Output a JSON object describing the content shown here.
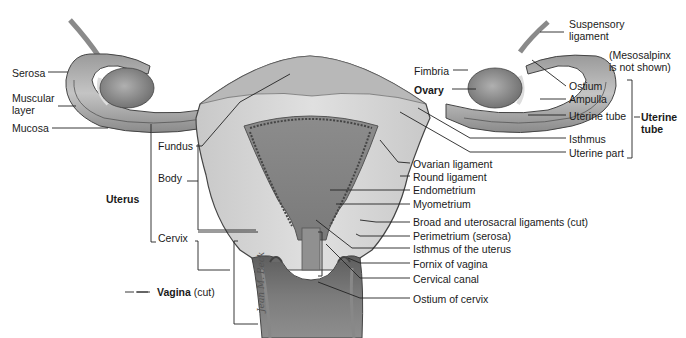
{
  "figure": {
    "signature": "Jean M. Beck",
    "labels_left": {
      "serosa": "Serosa",
      "muscular_layer_1": "Muscular",
      "muscular_layer_2": "layer",
      "mucosa": "Mucosa",
      "fundus": "Fundus",
      "body": "Body",
      "uterus": "Uterus",
      "cervix": "Cervix",
      "vagina": "Vagina",
      "vagina_suffix": "(cut)"
    },
    "labels_right": {
      "suspensory_1": "Suspensory",
      "suspensory_2": "ligament",
      "mesosalpinx_1": "(Mesosalpinx",
      "mesosalpinx_2": "is not shown)",
      "fimbria": "Fimbria",
      "ovary": "Ovary",
      "ostium": "Ostium",
      "ampulla": "Ampulla",
      "uterine_tube_part": "Uterine tube",
      "uterine_tube_group_1": "Uterine",
      "uterine_tube_group_2": "tube",
      "isthmus": "Isthmus",
      "uterine_part": "Uterine part",
      "ovarian_ligament": "Ovarian ligament",
      "round_ligament": "Round ligament",
      "endometrium": "Endometrium",
      "myometrium": "Myometrium",
      "broad_ligaments": "Broad and uterosacral ligaments (cut)",
      "perimetrium": "Perimetrium (serosa)",
      "isthmus_uterus": "Isthmus of the uterus",
      "fornix": "Fornix of vagina",
      "cervical_canal": "Cervical canal",
      "ostium_cervix": "Ostium of cervix"
    }
  }
}
